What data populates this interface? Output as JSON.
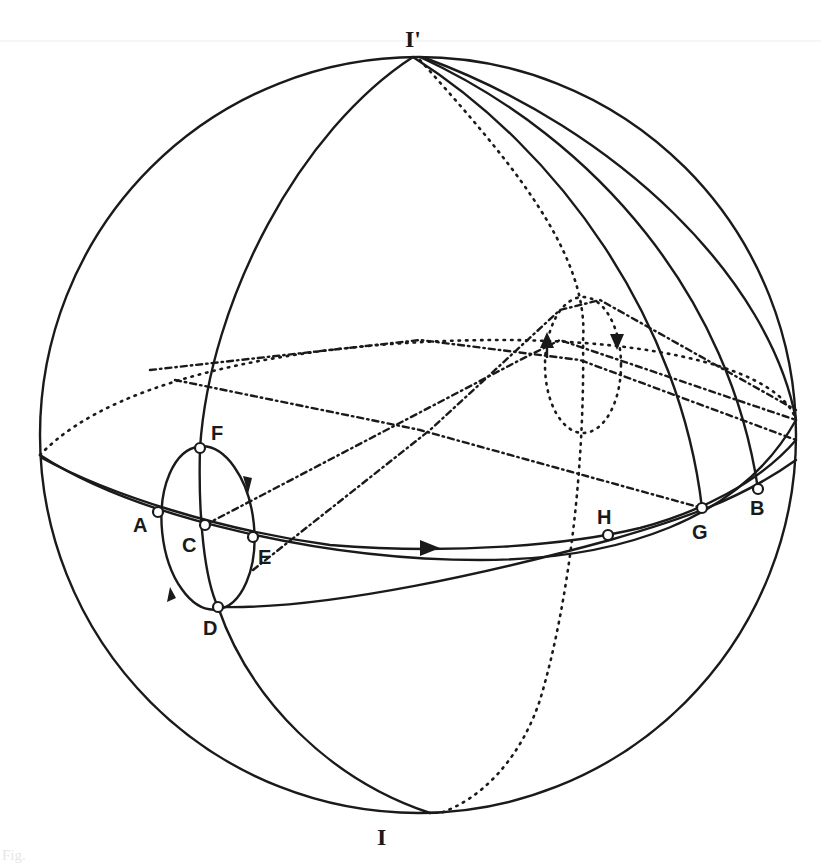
{
  "figure": {
    "type": "sphere-diagram",
    "poles": {
      "top": {
        "label": "I'"
      },
      "bottom": {
        "label": "I"
      }
    },
    "points": [
      {
        "id": "A",
        "label": "A"
      },
      {
        "id": "B",
        "label": "B"
      },
      {
        "id": "C",
        "label": "C"
      },
      {
        "id": "D",
        "label": "D"
      },
      {
        "id": "E",
        "label": "E"
      },
      {
        "id": "F",
        "label": "F"
      },
      {
        "id": "G",
        "label": "G"
      },
      {
        "id": "H",
        "label": "H"
      }
    ],
    "caption_fragment": "Fig.",
    "colors": {
      "ink": "#1a1a1a",
      "paper": "#ffffff"
    }
  }
}
